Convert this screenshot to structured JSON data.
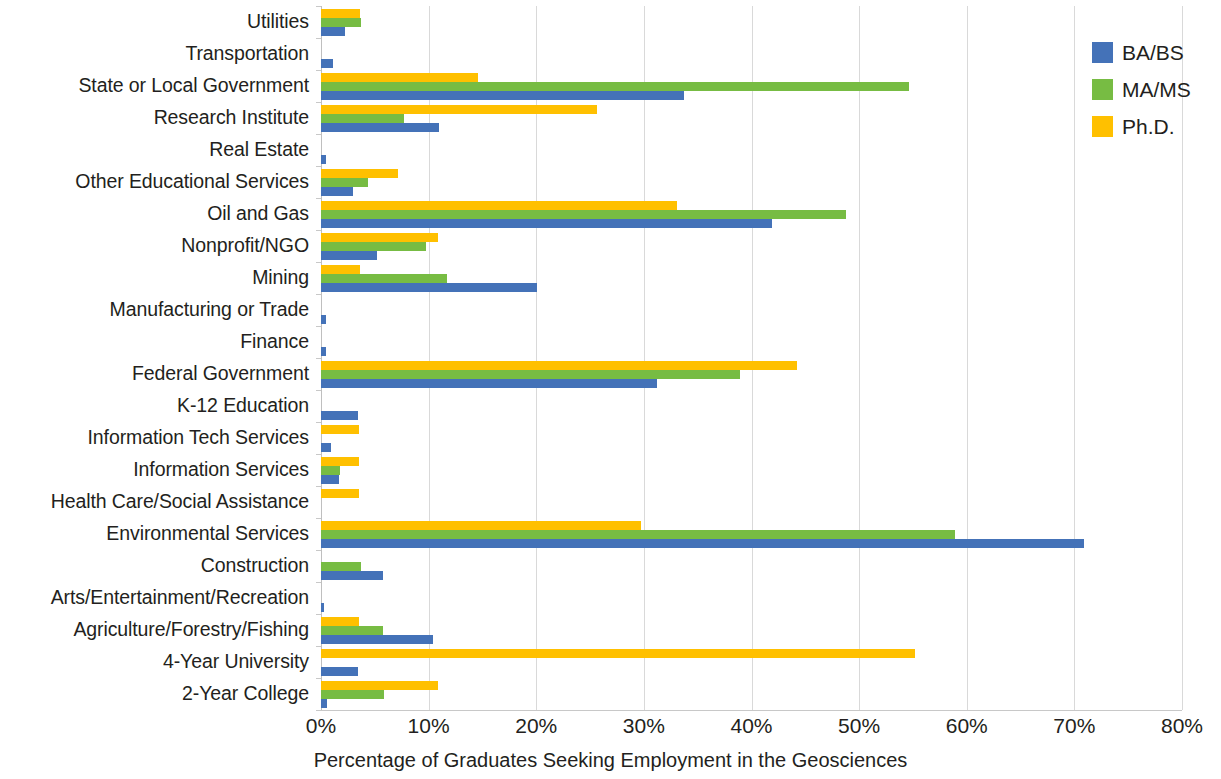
{
  "chart_data": {
    "type": "bar",
    "orientation": "horizontal",
    "title": "",
    "xlabel": "Percentage of Graduates Seeking Employment in the Geosciences",
    "ylabel": "",
    "xlim": [
      0,
      80
    ],
    "xtick_labels": [
      "0%",
      "10%",
      "20%",
      "30%",
      "40%",
      "50%",
      "60%",
      "70%",
      "80%"
    ],
    "xticks": [
      0,
      10,
      20,
      30,
      40,
      50,
      60,
      70,
      80
    ],
    "grid": "vertical",
    "legend_position": "top-right",
    "categories": [
      "Utilities",
      "Transportation",
      "State or Local Government",
      "Research Institute",
      "Real Estate",
      "Other Educational Services",
      "Oil and Gas",
      "Nonprofit/NGO",
      "Mining",
      "Manufacturing or Trade",
      "Finance",
      "Federal Government",
      "K-12 Education",
      "Information Tech Services",
      "Information Services",
      "Health Care/Social Assistance",
      "Environmental Services",
      "Construction",
      "Arts/Entertainment/Recreation",
      "Agriculture/Forestry/Fishing",
      "4-Year University",
      "2-Year College"
    ],
    "series": [
      {
        "name": "BA/BS",
        "color": "#4472b8",
        "values": [
          2.2,
          1.1,
          33.7,
          11.0,
          0.5,
          3.0,
          41.9,
          5.2,
          20.1,
          0.5,
          0.5,
          31.2,
          3.4,
          0.9,
          1.7,
          0.0,
          70.9,
          5.8,
          0.3,
          10.4,
          3.4,
          0.6
        ]
      },
      {
        "name": "MA/MS",
        "color": "#77bc43",
        "values": [
          3.7,
          0.0,
          54.6,
          7.7,
          0.0,
          4.4,
          48.8,
          9.8,
          11.7,
          0.0,
          0.0,
          38.9,
          0.0,
          0.0,
          1.8,
          0.0,
          58.9,
          3.7,
          0.0,
          5.8,
          0.0,
          5.9
        ]
      },
      {
        "name": "Ph.D.",
        "color": "#ffc000",
        "values": [
          3.6,
          0.0,
          14.6,
          25.6,
          0.0,
          7.2,
          33.1,
          10.9,
          3.6,
          0.0,
          0.0,
          44.2,
          0.0,
          3.5,
          3.5,
          3.5,
          29.7,
          0.0,
          0.0,
          3.5,
          55.2,
          10.9
        ]
      }
    ]
  },
  "legend": {
    "items": [
      {
        "label": "BA/BS",
        "color": "#4472b8"
      },
      {
        "label": "MA/MS",
        "color": "#77bc43"
      },
      {
        "label": "Ph.D.",
        "color": "#ffc000"
      }
    ]
  },
  "axis": {
    "x_title": "Percentage of Graduates Seeking Employment in the Geosciences"
  }
}
